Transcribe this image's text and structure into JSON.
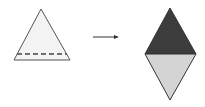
{
  "diagram": {
    "colors": {
      "background": "#ffffff",
      "outline": "#444444",
      "triangle_fill": "#f3f3f3",
      "diamond_top": "#3c3c3c",
      "diamond_bottom": "#d4d4d4",
      "arrow": "#333333"
    },
    "shapes": [
      {
        "id": "source-triangle",
        "type": "triangle",
        "dashed_line": true
      },
      {
        "id": "transform-arrow",
        "type": "arrow",
        "direction": "right"
      },
      {
        "id": "result-diamond",
        "type": "rhombus",
        "top_half": "dark",
        "bottom_half": "light"
      }
    ]
  }
}
